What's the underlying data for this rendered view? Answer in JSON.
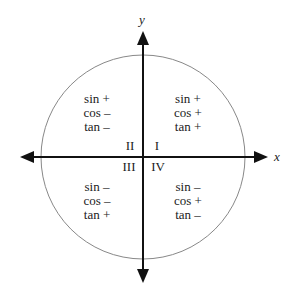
{
  "diagram": {
    "axes": {
      "x_label": "x",
      "y_label": "y"
    },
    "colors": {
      "circle": "#888888",
      "axis": "#111111",
      "text": "#222222"
    },
    "quadrants": [
      {
        "numeral": "I",
        "lines": [
          "sin +",
          "cos +",
          "tan +"
        ]
      },
      {
        "numeral": "II",
        "lines": [
          "sin +",
          "cos –",
          "tan –"
        ]
      },
      {
        "numeral": "III",
        "lines": [
          "sin –",
          "cos –",
          "tan +"
        ]
      },
      {
        "numeral": "IV",
        "lines": [
          "sin –",
          "cos +",
          "tan –"
        ]
      }
    ]
  }
}
